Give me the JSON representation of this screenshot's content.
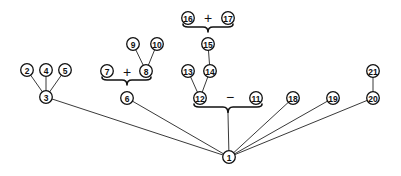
{
  "diagram": {
    "type": "tree",
    "root": "1",
    "nodes": [
      {
        "id": "1",
        "label": "1"
      },
      {
        "id": "2",
        "label": "2"
      },
      {
        "id": "3",
        "label": "3"
      },
      {
        "id": "4",
        "label": "4"
      },
      {
        "id": "5",
        "label": "5"
      },
      {
        "id": "6",
        "label": "6"
      },
      {
        "id": "7",
        "label": "7"
      },
      {
        "id": "8",
        "label": "8"
      },
      {
        "id": "9",
        "label": "9"
      },
      {
        "id": "10",
        "label": "10"
      },
      {
        "id": "11",
        "label": "11"
      },
      {
        "id": "12",
        "label": "12"
      },
      {
        "id": "13",
        "label": "13"
      },
      {
        "id": "14",
        "label": "14"
      },
      {
        "id": "15",
        "label": "15"
      },
      {
        "id": "16",
        "label": "16"
      },
      {
        "id": "17",
        "label": "17"
      },
      {
        "id": "18",
        "label": "18"
      },
      {
        "id": "19",
        "label": "19"
      },
      {
        "id": "20",
        "label": "20"
      },
      {
        "id": "21",
        "label": "21"
      }
    ],
    "edges": [
      [
        "1",
        "3"
      ],
      [
        "1",
        "6"
      ],
      [
        "1",
        "12-11-group"
      ],
      [
        "1",
        "18"
      ],
      [
        "1",
        "19"
      ],
      [
        "1",
        "20"
      ],
      [
        "3",
        "2"
      ],
      [
        "3",
        "4"
      ],
      [
        "3",
        "5"
      ],
      [
        "8",
        "9"
      ],
      [
        "8",
        "10"
      ],
      [
        "12",
        "13"
      ],
      [
        "12",
        "14"
      ],
      [
        "14",
        "15"
      ],
      [
        "20",
        "21"
      ]
    ],
    "groups": [
      {
        "id": "7-8-group",
        "members": [
          "7",
          "8"
        ],
        "operator": "+",
        "parent": "6"
      },
      {
        "id": "16-17-group",
        "members": [
          "16",
          "17"
        ],
        "operator": "+",
        "parent": "15"
      },
      {
        "id": "12-11-group",
        "members": [
          "12",
          "11"
        ],
        "operator": "−",
        "parent": "1"
      }
    ]
  }
}
